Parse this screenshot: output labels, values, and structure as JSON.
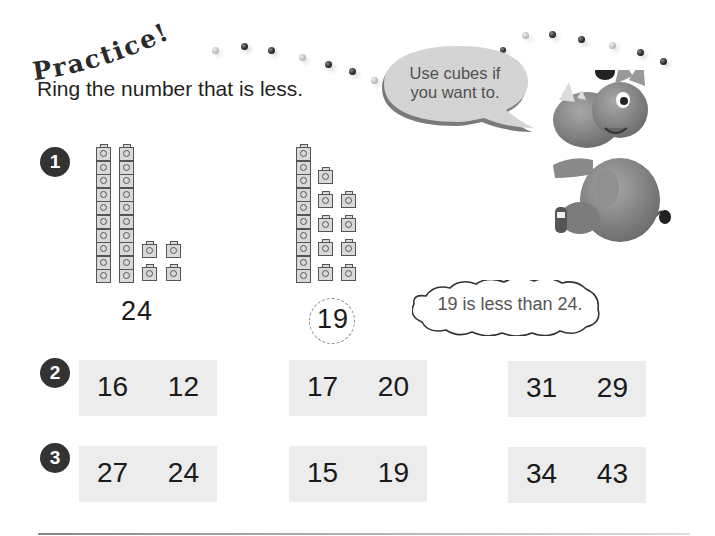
{
  "header": {
    "title": "Practice!",
    "instruction": "Ring the number that is less."
  },
  "speech_bubble": {
    "line1": "Use cubes if",
    "line2": "you want to."
  },
  "mascot": {
    "name": "rhino-mascot"
  },
  "example": {
    "badge": "1",
    "left_number": "24",
    "left_tens": 2,
    "left_ones": 4,
    "right_number": "19",
    "right_tens": 1,
    "right_ones": 9,
    "answer_ringed": "19",
    "explanation": "19 is less than 24."
  },
  "exercises": [
    {
      "badge": "2",
      "pairs": [
        {
          "a": "16",
          "b": "12"
        },
        {
          "a": "17",
          "b": "20"
        },
        {
          "a": "31",
          "b": "29"
        }
      ]
    },
    {
      "badge": "3",
      "pairs": [
        {
          "a": "27",
          "b": "24"
        },
        {
          "a": "15",
          "b": "19"
        },
        {
          "a": "34",
          "b": "43"
        }
      ]
    }
  ],
  "colors": {
    "badge": "#333333",
    "num_box": "#ececec",
    "speech_bubble": "#d4d4d4"
  }
}
